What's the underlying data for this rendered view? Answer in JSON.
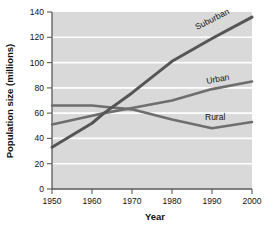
{
  "chart_data": {
    "type": "line",
    "title": "",
    "xlabel": "Year",
    "ylabel": "Population size (millions)",
    "xlim": [
      1950,
      2000
    ],
    "ylim": [
      0,
      140
    ],
    "xticks": [
      1950,
      1960,
      1970,
      1980,
      1990,
      2000
    ],
    "yticks": [
      0,
      20,
      40,
      60,
      80,
      100,
      120,
      140
    ],
    "grid": "horizontal-white",
    "legend": "inline-labels-at-line-ends",
    "plot_background": "#d9d9d9",
    "x": [
      1950,
      1960,
      1963,
      1970,
      1980,
      1990,
      2000
    ],
    "series": [
      {
        "name": "Suburban",
        "color": "#555555",
        "values": [
          33,
          52,
          60,
          76,
          101,
          119,
          136
        ]
      },
      {
        "name": "Urban",
        "color": "#6e6e6e",
        "values": [
          51,
          58,
          60,
          64,
          70,
          79,
          85
        ]
      },
      {
        "name": "Rural",
        "color": "#6e6e6e",
        "values": [
          66,
          66,
          65,
          63,
          55,
          48,
          53
        ]
      }
    ]
  },
  "axes": {
    "y_label": "Population size (millions)",
    "x_label": "Year",
    "y_ticks": [
      "0",
      "20",
      "40",
      "60",
      "80",
      "100",
      "120",
      "140"
    ],
    "x_ticks": [
      "1950",
      "1960",
      "1970",
      "1980",
      "1990",
      "2000"
    ]
  },
  "series_labels": {
    "suburban": "Suburban",
    "urban": "Urban",
    "rural": "Rural"
  }
}
